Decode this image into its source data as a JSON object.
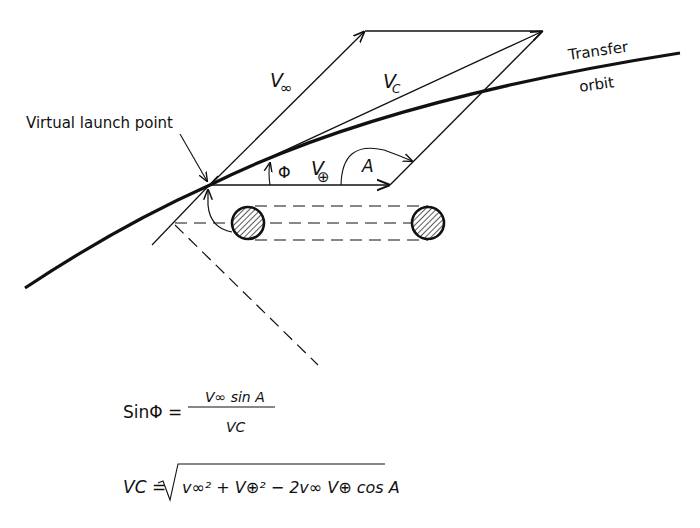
{
  "diagram": {
    "labels": {
      "virtual_launch_point": "Virtual launch point",
      "transfer_line1": "Transfer",
      "transfer_line2": "orbit",
      "v_inf": "V",
      "v_inf_sub": "∞",
      "v_c": "V",
      "v_c_sub": "C",
      "v_earth": "V",
      "v_earth_sub": "⊕",
      "phi": "Φ",
      "angle_a": "A"
    },
    "points": {
      "launch_point": [
        210,
        185
      ],
      "v_inf_tip": [
        365,
        31
      ],
      "v_c_tip": [
        543,
        31
      ],
      "v_earth_tip": [
        390,
        185
      ]
    },
    "colors": {
      "ink": "#111111",
      "background": "#ffffff"
    }
  },
  "equations": {
    "eq1": {
      "lhs": "SinΦ =",
      "numerator": "V∞ sin A",
      "denominator": "VC"
    },
    "eq2": {
      "lhs": "VC =",
      "radicand": "v∞² + V⊕² − 2v∞ V⊕ cos A"
    }
  }
}
